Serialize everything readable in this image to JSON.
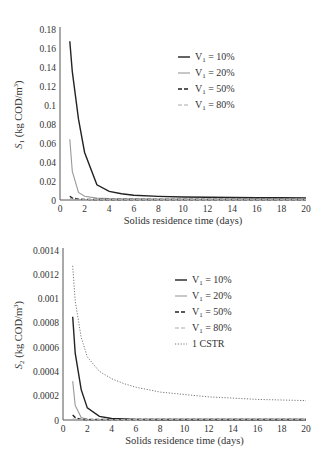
{
  "chart_data": [
    {
      "type": "line",
      "title": "",
      "xlabel": "Solids residence time (days)",
      "ylabel": "S1 (kg COD/m3)",
      "ylabel_main": "S",
      "ylabel_sub": "1",
      "ylabel_rest": " (kg COD/m",
      "ylabel_sup": "3",
      "ylabel_end": ")",
      "xlim": [
        0,
        20
      ],
      "ylim": [
        0,
        0.18
      ],
      "xticks": [
        "0",
        "2",
        "4",
        "6",
        "8",
        "10",
        "12",
        "14",
        "16",
        "18",
        "20"
      ],
      "yticks": [
        "0",
        "0.02",
        "0.04",
        "0.06",
        "0.08",
        "0.1",
        "0.12",
        "0.14",
        "0.16",
        "0.18"
      ],
      "grid": false,
      "legend_position": "upper right",
      "series": [
        {
          "name": "V1 = 10%",
          "label_main": "V",
          "label_sub": "1",
          "label_rest": " = 10%",
          "style": "solid",
          "color": "#222222",
          "x": [
            0.8,
            1,
            1.5,
            2,
            3,
            4,
            5,
            6,
            8,
            10,
            12,
            14,
            16,
            18,
            20
          ],
          "y": [
            0.167,
            0.135,
            0.085,
            0.05,
            0.016,
            0.009,
            0.0065,
            0.005,
            0.0038,
            0.0032,
            0.0028,
            0.0026,
            0.0024,
            0.0023,
            0.0022
          ]
        },
        {
          "name": "V1 = 20%",
          "label_main": "V",
          "label_sub": "1",
          "label_rest": " = 20%",
          "style": "solid",
          "color": "#999999",
          "x": [
            0.8,
            1,
            1.5,
            2,
            3,
            4,
            6,
            8,
            10,
            20
          ],
          "y": [
            0.064,
            0.03,
            0.008,
            0.004,
            0.002,
            0.0015,
            0.0012,
            0.001,
            0.001,
            0.0009
          ]
        },
        {
          "name": "V1 = 50%",
          "label_main": "V",
          "label_sub": "1",
          "label_rest": " = 50%",
          "style": "dashed",
          "color": "#222222",
          "x": [
            0.8,
            1,
            1.5,
            2,
            4,
            10,
            20
          ],
          "y": [
            0.004,
            0.002,
            0.001,
            0.0006,
            0.0004,
            0.0003,
            0.0003
          ]
        },
        {
          "name": "V1 = 80%",
          "label_main": "V",
          "label_sub": "1",
          "label_rest": " = 80%",
          "style": "dashed",
          "color": "#aaaaaa",
          "x": [
            0.8,
            1,
            2,
            4,
            10,
            20
          ],
          "y": [
            0.002,
            0.001,
            0.0005,
            0.0003,
            0.0002,
            0.0002
          ]
        }
      ]
    },
    {
      "type": "line",
      "title": "",
      "xlabel": "Solids residence time (days)",
      "ylabel": "S2 (kg COD/m3)",
      "ylabel_main": "S",
      "ylabel_sub": "2",
      "ylabel_rest": " (kg COD/m",
      "ylabel_sup": "3",
      "ylabel_end": ")",
      "xlim": [
        0,
        20
      ],
      "ylim": [
        0,
        0.0014
      ],
      "xticks": [
        "0",
        "2",
        "4",
        "6",
        "8",
        "10",
        "12",
        "14",
        "16",
        "18",
        "20"
      ],
      "yticks": [
        "0",
        "0.0002",
        "0.0004",
        "0.0006",
        "0.0008",
        "0.001",
        "0.0012",
        "0.0014"
      ],
      "grid": false,
      "legend_position": "upper right",
      "series": [
        {
          "name": "V1 = 10%",
          "label_main": "V",
          "label_sub": "1",
          "label_rest": " = 10%",
          "style": "solid",
          "color": "#222222",
          "x": [
            0.8,
            1,
            1.5,
            2,
            3,
            4,
            6,
            8,
            10,
            20
          ],
          "y": [
            0.00085,
            0.00055,
            0.00025,
            0.0001,
            3e-05,
            1.2e-05,
            5e-06,
            3e-06,
            2e-06,
            1e-06
          ]
        },
        {
          "name": "V1 = 20%",
          "label_main": "V",
          "label_sub": "1",
          "label_rest": " = 20%",
          "style": "solid",
          "color": "#999999",
          "x": [
            0.8,
            1,
            1.5,
            2,
            4,
            20
          ],
          "y": [
            0.00032,
            0.00012,
            2e-05,
            5e-06,
            1e-06,
            5e-07
          ]
        },
        {
          "name": "V1 = 50%",
          "label_main": "V",
          "label_sub": "1",
          "label_rest": " = 50%",
          "style": "dashed",
          "color": "#222222",
          "x": [
            0.8,
            1,
            1.5,
            2,
            20
          ],
          "y": [
            4e-05,
            2e-05,
            5e-06,
            1e-06,
            5e-07
          ]
        },
        {
          "name": "V1 = 80%",
          "label_main": "V",
          "label_sub": "1",
          "label_rest": " = 80%",
          "style": "dashed",
          "color": "#aaaaaa",
          "x": [
            0.8,
            1,
            2,
            20
          ],
          "y": [
            1e-05,
            5e-06,
            1e-06,
            5e-07
          ]
        },
        {
          "name": "1 CSTR",
          "label_main": "1 CSTR",
          "label_sub": "",
          "label_rest": "",
          "style": "dotted",
          "color": "#777777",
          "x": [
            0.8,
            1,
            1.5,
            2,
            3,
            4,
            5,
            6,
            8,
            10,
            12,
            14,
            16,
            18,
            20
          ],
          "y": [
            0.00127,
            0.00098,
            0.00068,
            0.00052,
            0.0004,
            0.00034,
            0.0003,
            0.00027,
            0.00023,
            0.00021,
            0.00019,
            0.00018,
            0.00017,
            0.000165,
            0.00016
          ]
        }
      ]
    }
  ]
}
